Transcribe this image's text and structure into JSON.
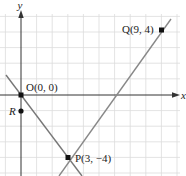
{
  "axes": {
    "x_label": "x",
    "y_label": "y"
  },
  "points": [
    {
      "name": "O",
      "label": "O(0, 0)",
      "x": 0,
      "y": 0
    },
    {
      "name": "Q",
      "label": "Q(9, 4)",
      "x": 9,
      "y": 4
    },
    {
      "name": "P",
      "label": "P(3, −4)",
      "x": 3,
      "y": -4
    },
    {
      "name": "R",
      "label": "R",
      "x": 0,
      "y": -1
    }
  ],
  "lines": [
    {
      "name": "line-OP",
      "through": [
        "O",
        "P"
      ],
      "slope": "-4/3"
    },
    {
      "name": "line-PQ",
      "through": [
        "P",
        "Q"
      ],
      "slope": "4/3"
    }
  ],
  "colors": {
    "grid": "#dcdcdc",
    "axis": "#333333",
    "line": "#777777",
    "point": "#111111"
  }
}
